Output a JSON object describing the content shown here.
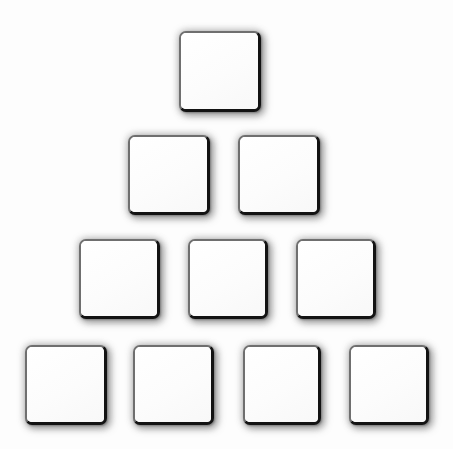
{
  "canvas": {
    "width": 453,
    "height": 449,
    "background_color": "#fdfdfd",
    "title": "Square Pyramid"
  },
  "style": {
    "tile_fill": "#ffffff",
    "tile_border_light": "#6f6f6f",
    "tile_border_dark": "#131313",
    "shadow_color": "#5a5a5a",
    "corner_radius": 7
  },
  "figure": {
    "shape": "pyramid",
    "total_tiles": 10,
    "row_count": 4,
    "tiles_per_row": [
      1,
      2,
      3,
      4
    ],
    "tile_width": 82,
    "tile_height": 81
  },
  "rows": [
    {
      "index": 1,
      "label": "row-1",
      "y": 31,
      "count": 1,
      "tiles": [
        {
          "id": "tile-1-1",
          "label": "",
          "x": 179,
          "y": 31,
          "w": 82,
          "h": 81
        }
      ]
    },
    {
      "index": 2,
      "label": "row-2",
      "y": 135,
      "count": 2,
      "tiles": [
        {
          "id": "tile-2-1",
          "label": "",
          "x": 128,
          "y": 135,
          "w": 82,
          "h": 80
        },
        {
          "id": "tile-2-2",
          "label": "",
          "x": 238,
          "y": 135,
          "w": 82,
          "h": 80
        }
      ]
    },
    {
      "index": 3,
      "label": "row-3",
      "y": 239,
      "count": 3,
      "tiles": [
        {
          "id": "tile-3-1",
          "label": "",
          "x": 79,
          "y": 239,
          "w": 81,
          "h": 80
        },
        {
          "id": "tile-3-2",
          "label": "",
          "x": 188,
          "y": 239,
          "w": 80,
          "h": 80
        },
        {
          "id": "tile-3-3",
          "label": "",
          "x": 296,
          "y": 239,
          "w": 80,
          "h": 80
        }
      ]
    },
    {
      "index": 4,
      "label": "row-4",
      "y": 345,
      "count": 4,
      "tiles": [
        {
          "id": "tile-4-1",
          "label": "",
          "x": 25,
          "y": 345,
          "w": 82,
          "h": 80
        },
        {
          "id": "tile-4-2",
          "label": "",
          "x": 133,
          "y": 345,
          "w": 81,
          "h": 80
        },
        {
          "id": "tile-4-3",
          "label": "",
          "x": 243,
          "y": 345,
          "w": 78,
          "h": 80
        },
        {
          "id": "tile-4-4",
          "label": "",
          "x": 349,
          "y": 345,
          "w": 80,
          "h": 80
        }
      ]
    }
  ]
}
